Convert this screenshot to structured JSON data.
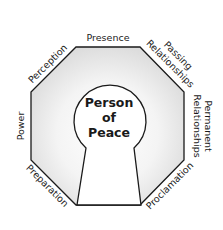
{
  "diagram": {
    "center": {
      "line1": "Person",
      "line2": "of",
      "line3": "Peace"
    },
    "sides": {
      "top": "Presence",
      "top_left": "Perception",
      "top_right_line1": "Passing",
      "top_right_line2": "Relationships",
      "right_line1": "Permanent",
      "right_line2": "Relationships",
      "left": "Power",
      "bottom_left": "Preparation",
      "bottom_right": "Proclamation"
    },
    "colors": {
      "outline": "#1a1a1a",
      "fill_gradient_outer": "#dcdcdc",
      "fill_gradient_inner": "#ffffff",
      "keyhole_fill": "#ffffff"
    }
  }
}
